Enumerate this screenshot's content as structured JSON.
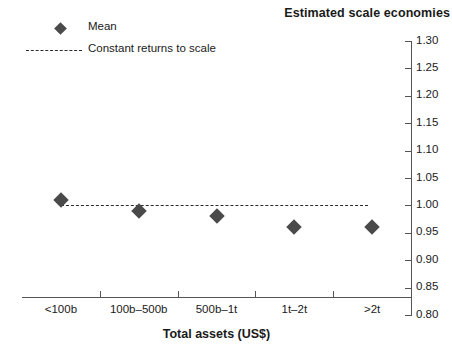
{
  "chart_data": {
    "type": "scatter",
    "title": "Estimated scale economies",
    "xlabel": "Total assets (US$)",
    "ylabel": "",
    "categories": [
      "<100b",
      "100b–500b",
      "500b–1t",
      "1t–2t",
      ">2t"
    ],
    "series": [
      {
        "name": "Mean",
        "marker": "diamond",
        "color": "#4a4a4a",
        "values": [
          1.01,
          0.99,
          0.98,
          0.96,
          0.96
        ]
      }
    ],
    "reference_line": {
      "name": "Constant returns to scale",
      "value": 1.0,
      "style": "dashed",
      "color": "#2b2b2b"
    },
    "ylim": [
      0.8,
      1.3
    ],
    "ytick_step": 0.05,
    "ytick_labels": [
      "1.30",
      "1.25",
      "1.20",
      "1.15",
      "1.10",
      "1.05",
      "1.00",
      "0.95",
      "0.90",
      "0.85",
      "0.80"
    ],
    "yaxis_position": "right",
    "grid": false,
    "legend_position": "top-left"
  },
  "legend": {
    "items": [
      {
        "label": "Mean",
        "key": "diamond-marker"
      },
      {
        "label": "Constant returns to scale",
        "key": "dashed-line"
      }
    ]
  },
  "colors": {
    "marker": "#4a4a4a",
    "reference_line": "#2b2b2b",
    "axis": "#555555",
    "text": "#1a1a1a",
    "background": "#ffffff"
  }
}
